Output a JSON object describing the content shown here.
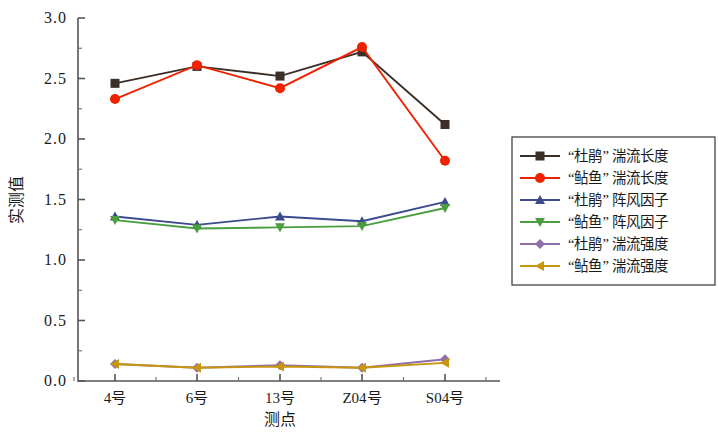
{
  "chart_data": {
    "type": "line",
    "title": "",
    "xlabel": "测点",
    "ylabel": "实测值",
    "categories": [
      "4号",
      "6号",
      "13号",
      "Z04号",
      "S04号"
    ],
    "ylim": [
      0.0,
      3.0
    ],
    "ytick_labels": [
      "0.0",
      "0.5",
      "1.0",
      "1.5",
      "2.0",
      "2.5",
      "3.0"
    ],
    "ytick_values": [
      0.0,
      0.5,
      1.0,
      1.5,
      2.0,
      2.5,
      3.0
    ],
    "yminor_step": 0.25,
    "grid": false,
    "legend_position": "right",
    "series": [
      {
        "name": "“杜鹃”湍流长度",
        "label": "“杜鹃” 湍流长度",
        "color": "#3b2f27",
        "marker": "square",
        "values": [
          2.46,
          2.6,
          2.52,
          2.72,
          2.12
        ]
      },
      {
        "name": "“鲇鱼”湍流长度",
        "label": "“鲇鱼” 湍流长度",
        "color": "#ee2200",
        "marker": "circle",
        "values": [
          2.33,
          2.61,
          2.42,
          2.76,
          1.82
        ]
      },
      {
        "name": "“杜鹃”阵风因子",
        "label": "“杜鹃” 阵风因子",
        "color": "#3b4a8c",
        "marker": "triangle-up",
        "values": [
          1.36,
          1.29,
          1.36,
          1.32,
          1.48
        ]
      },
      {
        "name": "“鲇鱼”阵风因子",
        "label": "“鲇鱼” 阵风因子",
        "color": "#4a9e3f",
        "marker": "triangle-down",
        "values": [
          1.33,
          1.26,
          1.27,
          1.28,
          1.43
        ]
      },
      {
        "name": "“杜鹃”湍流强度",
        "label": "“杜鹃” 湍流强度",
        "color": "#8f6fa8",
        "marker": "diamond",
        "values": [
          0.14,
          0.11,
          0.13,
          0.11,
          0.18
        ]
      },
      {
        "name": "“鲇鱼”湍流强度",
        "label": "“鲇鱼” 湍流强度",
        "color": "#c8960c",
        "marker": "triangle-left",
        "values": [
          0.14,
          0.11,
          0.12,
          0.11,
          0.15
        ]
      }
    ]
  }
}
